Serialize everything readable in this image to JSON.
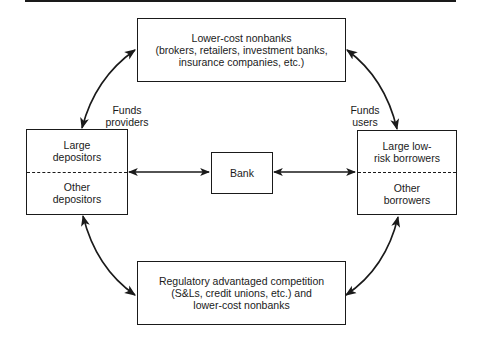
{
  "diagram": {
    "top_box": {
      "lines": [
        "Lower-cost nonbanks",
        "(brokers, retailers, investment banks,",
        "insurance companies, etc.)"
      ]
    },
    "bottom_box": {
      "lines": [
        "Regulatory advantaged competition",
        "(S&Ls, credit unions, etc.) and",
        "lower-cost nonbanks"
      ]
    },
    "center_box": {
      "label": "Bank"
    },
    "left_box": {
      "upper": [
        "Large",
        "depositors"
      ],
      "lower": [
        "Other",
        "depositors"
      ]
    },
    "right_box": {
      "upper": [
        "Large low-",
        "risk borrowers"
      ],
      "lower": [
        "Other",
        "borrowers"
      ]
    },
    "left_label": [
      "Funds",
      "providers"
    ],
    "right_label": [
      "Funds",
      "users"
    ],
    "colors": {
      "ink": "#1a1a1a",
      "background": "#ffffff"
    },
    "edges": [
      {
        "from": "left_box",
        "to": "top_box",
        "type": "bidirectional-curve"
      },
      {
        "from": "right_box",
        "to": "top_box",
        "type": "bidirectional-curve"
      },
      {
        "from": "left_box",
        "to": "bottom_box",
        "type": "bidirectional-curve"
      },
      {
        "from": "right_box",
        "to": "bottom_box",
        "type": "bidirectional-curve"
      },
      {
        "from": "left_box",
        "to": "center_box",
        "type": "bidirectional"
      },
      {
        "from": "center_box",
        "to": "right_box",
        "type": "bidirectional"
      }
    ]
  }
}
